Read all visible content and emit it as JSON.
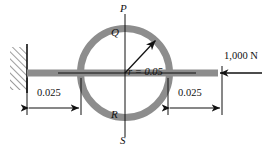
{
  "figure": {
    "type": "engineering-free-body-diagram",
    "colors": {
      "ring": "#8d8d8d",
      "bar": "#8d8d8d",
      "line": "#111111",
      "background": "#ffffff"
    },
    "points": {
      "p": "P",
      "q": "Q",
      "r": "R",
      "s": "S"
    },
    "radius_label": "r = 0.05",
    "radius_symbol": "r",
    "radius_equals": "=",
    "radius_value": "0.05",
    "force_label": "1,000 N",
    "force_magnitude": "1,000",
    "force_unit": "N",
    "dimension_left": "0.025",
    "dimension_right": "0.025",
    "geometry": {
      "center_x": 125,
      "center_y": 73,
      "outer_radius": 48,
      "ring_thickness": 7
    }
  }
}
